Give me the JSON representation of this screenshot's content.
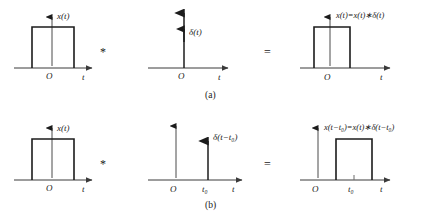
{
  "figure": {
    "rows": [
      {
        "id": "row-a",
        "caption": "(a)",
        "operator_convolution": "*",
        "operator_equals": "=",
        "panels": [
          {
            "id": "a-input",
            "kind": "rect-pulse",
            "signal_label": "x(t)",
            "origin_label": "O",
            "time_label": "t",
            "shift_label": null
          },
          {
            "id": "a-impulse",
            "kind": "impulse",
            "signal_label_prefix": "δ(",
            "signal_label_var": "t",
            "signal_label_suffix": ")",
            "signal_label": "δ(t)",
            "origin_label": "O",
            "time_label": "t",
            "shift_label": null
          },
          {
            "id": "a-output",
            "kind": "rect-pulse",
            "signal_label": "x(t)=x(t)∗δ(t)",
            "origin_label": "O",
            "time_label": "t",
            "shift_label": null
          }
        ]
      },
      {
        "id": "row-b",
        "caption": "(b)",
        "operator_convolution": "*",
        "operator_equals": "=",
        "panels": [
          {
            "id": "b-input",
            "kind": "rect-pulse",
            "signal_label": "x(t)",
            "origin_label": "O",
            "time_label": "t",
            "shift_label": null
          },
          {
            "id": "b-impulse",
            "kind": "impulse-shifted",
            "signal_label": "δ(t−t₀)",
            "origin_label": "O",
            "time_label": "t",
            "shift_label": "t₀"
          },
          {
            "id": "b-output",
            "kind": "rect-pulse-shifted",
            "signal_label": "x(t−t₀)=x(t)∗δ(t−t₀)",
            "origin_label": "O",
            "time_label": "t",
            "shift_label": "t₀"
          }
        ]
      }
    ],
    "text": {
      "delta": "δ",
      "x": "x",
      "t": "t",
      "t_sub": "0",
      "minus": "−",
      "equals": "=",
      "conv": "∗",
      "lparen": "(",
      "rparen": ")",
      "origin": "O",
      "caption_a": "(a)",
      "caption_b": "(b)"
    },
    "colors": {
      "background": "#ffffff",
      "stroke": "#1c1c1c",
      "axis": "#3a3a3a",
      "text": "#1a1a1a"
    }
  }
}
